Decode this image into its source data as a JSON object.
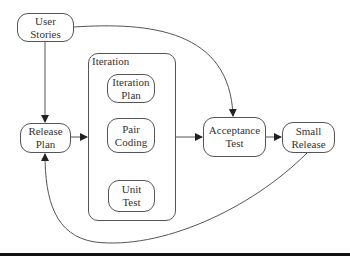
{
  "diagram": {
    "nodes": [
      {
        "id": "user-stories",
        "lines": [
          "User",
          "Stories"
        ]
      },
      {
        "id": "release-plan",
        "lines": [
          "Release",
          "Plan"
        ]
      },
      {
        "id": "iteration-plan",
        "lines": [
          "Iteration",
          "Plan"
        ]
      },
      {
        "id": "pair-coding",
        "lines": [
          "Pair",
          "Coding"
        ]
      },
      {
        "id": "unit-test",
        "lines": [
          "Unit",
          "Test"
        ]
      },
      {
        "id": "acceptance-test",
        "lines": [
          "Acceptance",
          "Test"
        ]
      },
      {
        "id": "small-release",
        "lines": [
          "Small",
          "Release"
        ]
      }
    ],
    "containers": [
      {
        "id": "iteration",
        "label": "Iteration",
        "contains": [
          "iteration-plan",
          "pair-coding",
          "unit-test"
        ]
      }
    ],
    "edges": [
      {
        "from": "user-stories",
        "to": "release-plan"
      },
      {
        "from": "user-stories",
        "to": "acceptance-test"
      },
      {
        "from": "release-plan",
        "to": "iteration"
      },
      {
        "from": "iteration-plan",
        "to": "pair-coding"
      },
      {
        "from": "pair-coding",
        "to": "unit-test"
      },
      {
        "from": "iteration",
        "to": "acceptance-test"
      },
      {
        "from": "acceptance-test",
        "to": "small-release"
      },
      {
        "from": "small-release",
        "to": "release-plan"
      }
    ],
    "colors": {
      "stroke": "#555555",
      "text": "#333333",
      "background": "#ffffff",
      "rule": "#111111"
    }
  }
}
